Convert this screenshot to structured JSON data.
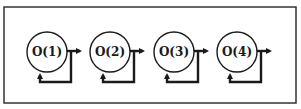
{
  "diagram": {
    "frame": {
      "x": 4,
      "y": 7,
      "width": 292,
      "height": 96,
      "stroke": "#333333"
    },
    "nodes": [
      {
        "label": "O(1)",
        "cx": 47,
        "cy": 52
      },
      {
        "label": "O(2)",
        "cx": 110,
        "cy": 52
      },
      {
        "label": "O(3)",
        "cx": 174,
        "cy": 52
      },
      {
        "label": "O(4)",
        "cx": 237,
        "cy": 52
      }
    ],
    "node_radius": 20,
    "colors": {
      "stroke": "#1a1a1a",
      "background": "#ffffff"
    },
    "edges": [
      {
        "type": "output-arrow",
        "from": "O(1)"
      },
      {
        "type": "self-feedback-loop",
        "node": "O(1)"
      },
      {
        "type": "output-arrow",
        "from": "O(2)"
      },
      {
        "type": "self-feedback-loop",
        "node": "O(2)"
      },
      {
        "type": "output-arrow",
        "from": "O(3)"
      },
      {
        "type": "self-feedback-loop",
        "node": "O(3)"
      },
      {
        "type": "output-arrow",
        "from": "O(4)"
      },
      {
        "type": "self-feedback-loop",
        "node": "O(4)"
      }
    ]
  }
}
